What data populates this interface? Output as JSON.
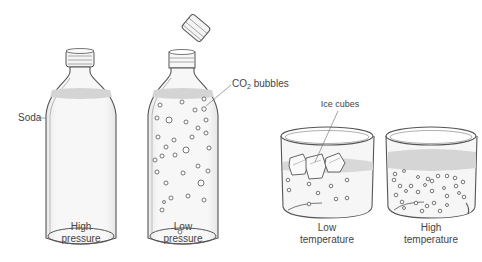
{
  "diagram": {
    "panels": [
      {
        "id": "high-pressure",
        "caption_line1": "High",
        "caption_line2": "pressure",
        "object": "sealed bottle with cap",
        "bubbles": 0
      },
      {
        "id": "low-pressure",
        "caption_line1": "Low",
        "caption_line2": "pressure",
        "object": "open bottle, cap removed",
        "bubbles": 32
      },
      {
        "id": "low-temperature",
        "caption_line1": "Low",
        "caption_line2": "temperature",
        "object": "beaker with ice cubes",
        "bubbles": 9
      },
      {
        "id": "high-temperature",
        "caption_line1": "High",
        "caption_line2": "temperature",
        "object": "beaker",
        "bubbles": 30
      }
    ],
    "labels": {
      "soda": "Soda",
      "co2_prefix": "CO",
      "co2_sub": "2",
      "co2_suffix": " bubbles",
      "ice_cubes": "Ice cubes"
    },
    "colors": {
      "outline": "#555555",
      "liquid": "#f1f1f1",
      "liquid_surface": "#d4d4d4",
      "leader": "#666666"
    }
  }
}
